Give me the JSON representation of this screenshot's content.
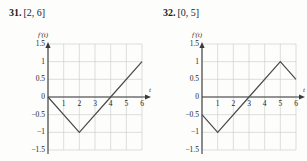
{
  "page": {
    "background": "#fdfdfc",
    "ink": "#2b2b2b"
  },
  "exercises": [
    {
      "number": "31.",
      "interval": "[2, 6]",
      "chart_data": {
        "type": "line",
        "title": "",
        "subtitle": "",
        "xlabel": "t",
        "ylabel": "f'(t)",
        "curve_label": "f'(t)",
        "xlim": [
          0,
          6
        ],
        "ylim": [
          -1.5,
          1.5
        ],
        "xticks": [
          1,
          2,
          3,
          4,
          5,
          6
        ],
        "xtick_labels": [
          "1",
          "2",
          "3",
          "4",
          "5",
          "6"
        ],
        "yticks": [
          -1.5,
          -1,
          -0.5,
          0,
          0.5,
          1,
          1.5
        ],
        "ytick_labels": [
          "-1.5",
          "-1",
          "-0.5",
          "0",
          "0.5",
          "1",
          "1.5"
        ],
        "grid": true,
        "grid_color": "#c9c9c9",
        "axis_color": "#3a3a3a",
        "line_color": "#4a4a4a",
        "legend": "none",
        "x": [
          0,
          2,
          4,
          6
        ],
        "values": [
          0,
          -1,
          0,
          1
        ],
        "points": [
          {
            "x": 0,
            "y": 0
          },
          {
            "x": 2,
            "y": -1
          },
          {
            "x": 4,
            "y": 0
          },
          {
            "x": 6,
            "y": 1
          }
        ]
      }
    },
    {
      "number": "32.",
      "interval": "[0, 5]",
      "chart_data": {
        "type": "line",
        "title": "",
        "subtitle": "",
        "xlabel": "t",
        "ylabel": "f'(t)",
        "curve_label": "f'(t)",
        "xlim": [
          0,
          6
        ],
        "ylim": [
          -1.5,
          1.5
        ],
        "xticks": [
          1,
          2,
          3,
          4,
          5,
          6
        ],
        "xtick_labels": [
          "1",
          "2",
          "3",
          "4",
          "5",
          "6"
        ],
        "yticks": [
          -1.5,
          -1,
          -0.5,
          0,
          0.5,
          1,
          1.5
        ],
        "ytick_labels": [
          "-1.5",
          "-1",
          "-0.5",
          "0",
          "0.5",
          "1",
          "1.5"
        ],
        "grid": true,
        "grid_color": "#c9c9c9",
        "axis_color": "#3a3a3a",
        "line_color": "#4a4a4a",
        "legend": "none",
        "x": [
          0,
          1,
          3,
          5,
          6
        ],
        "values": [
          -0.5,
          -1,
          0,
          1,
          0.5
        ],
        "points": [
          {
            "x": 0,
            "y": -0.5
          },
          {
            "x": 1,
            "y": -1
          },
          {
            "x": 3,
            "y": 0
          },
          {
            "x": 5,
            "y": 1
          },
          {
            "x": 6,
            "y": 0.5
          }
        ]
      }
    }
  ]
}
